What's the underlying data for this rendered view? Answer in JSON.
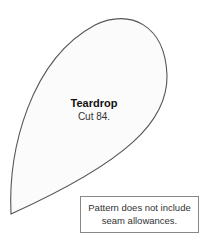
{
  "pattern": {
    "shape": "teardrop",
    "title": "Teardrop",
    "instruction": "Cut 84.",
    "outline_color": "#555555",
    "fill_color": "#fbfbfb"
  },
  "note": {
    "line1": "Pattern does not include",
    "line2": "seam allowances."
  }
}
